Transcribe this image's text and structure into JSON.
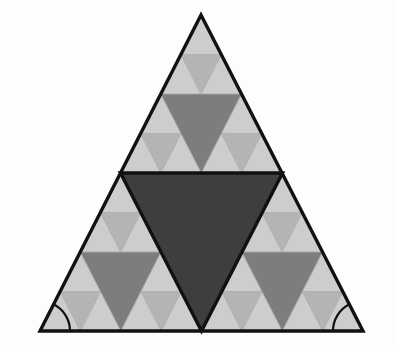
{
  "figure": {
    "type": "geometric-diagram",
    "canvas": {
      "width": 397,
      "height": 346,
      "background": "#fdfdfd"
    },
    "outer_triangle": {
      "name": "outer-triangle",
      "vertices": {
        "apex": [
          201,
          15
        ],
        "bottom_left": [
          40,
          331
        ],
        "bottom_right": [
          363,
          331
        ]
      },
      "stroke": "#111111",
      "stroke_width": 3.4,
      "fill": "none"
    },
    "recursion": {
      "levels": 3,
      "rule": "Each upright triangle is split into 4; the middle inverted triangle is shaded."
    },
    "palette": {
      "level1_center": "#3e3e3e",
      "level2_center": "#7d7d7d",
      "level3_center": "#b4b4b4",
      "base_upright": "#cdcdcd",
      "hairline": "#b0b0b0",
      "outline": "#111111",
      "background": "#fdfdfd"
    },
    "center_triangle": {
      "name": "central-inverted-triangle",
      "level": 1,
      "fill": "#3e3e3e",
      "stroke": "#111111",
      "stroke_width": 3.4,
      "vertices": {
        "left": [
          120.5,
          173
        ],
        "right": [
          282.5,
          173
        ],
        "bottom": [
          201.5,
          331
        ]
      }
    },
    "angle_marks": [
      {
        "name": "angle-arc-bottom-left",
        "at": [
          40,
          331
        ],
        "radius": 30,
        "stroke": "#111111",
        "stroke_width": 2.2
      },
      {
        "name": "angle-arc-bottom-right",
        "at": [
          363,
          331
        ],
        "radius": 30,
        "stroke": "#111111",
        "stroke_width": 2.2
      }
    ]
  }
}
